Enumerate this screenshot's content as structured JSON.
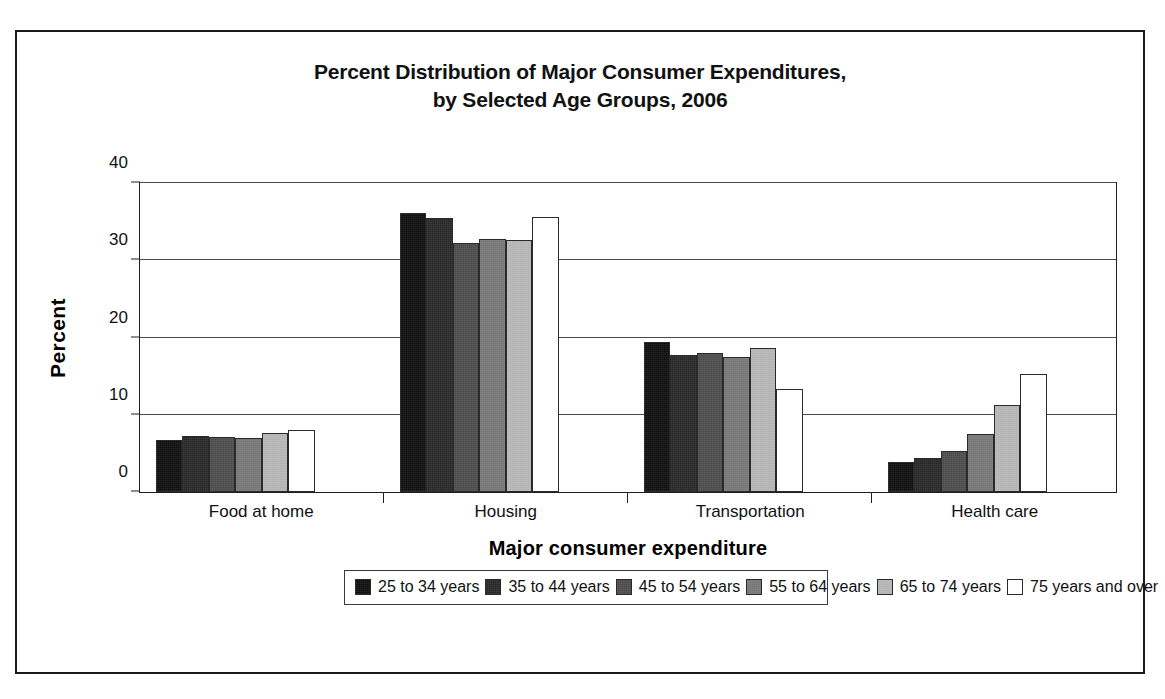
{
  "chart_data": {
    "type": "bar",
    "title": "Percent Distribution of Major Consumer Expenditures, by Selected Age Groups, 2006",
    "title_lines": [
      "Percent Distribution of Major Consumer Expenditures,",
      "by Selected Age Groups, 2006"
    ],
    "xlabel": "Major consumer expenditure",
    "ylabel": "Percent",
    "ylim": [
      0,
      40
    ],
    "yticks": [
      0,
      10,
      20,
      30,
      40
    ],
    "grid": true,
    "legend_position": "bottom",
    "categories": [
      "Food at home",
      "Housing",
      "Transportation",
      "Health care"
    ],
    "series": [
      {
        "name": "25 to 34 years",
        "color": "#0d0d0d",
        "values": [
          6.7,
          36.1,
          19.4,
          3.9
        ]
      },
      {
        "name": "35 to 44 years",
        "color": "#262626",
        "values": [
          7.2,
          35.5,
          17.8,
          4.4
        ]
      },
      {
        "name": "45 to 54 years",
        "color": "#4a4a4a",
        "values": [
          7.1,
          32.2,
          18.0,
          5.3
        ]
      },
      {
        "name": "55 to 64 years",
        "color": "#757575",
        "values": [
          7.0,
          32.7,
          17.5,
          7.5
        ]
      },
      {
        "name": "65 to 74 years",
        "color": "#b4b4b4",
        "values": [
          7.6,
          32.6,
          18.7,
          11.2
        ]
      },
      {
        "name": "75 years and over",
        "color": "#ffffff",
        "values": [
          8.0,
          35.6,
          13.4,
          15.3
        ]
      }
    ]
  },
  "legend": {
    "items": [
      "25 to 34 years",
      "35 to 44 years",
      "45 to 54 years",
      "55 to 64 years",
      "65 to 74 years",
      "75 years and over"
    ]
  }
}
